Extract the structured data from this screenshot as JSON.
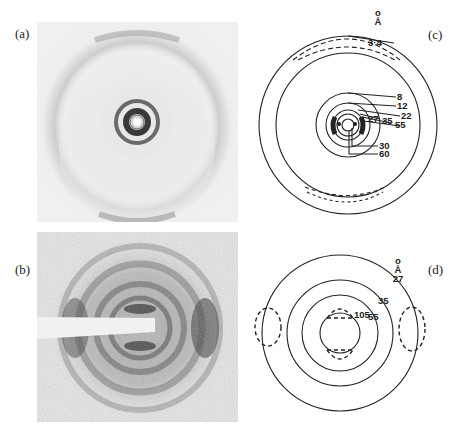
{
  "figure": {
    "panels": [
      {
        "id": "a",
        "label": "(a)",
        "type": "diffraction-photograph",
        "description": "X-ray diffraction pattern with strong central rings and faint outer arcs top and bottom"
      },
      {
        "id": "b",
        "label": "(b)",
        "type": "diffraction-photograph",
        "description": "Grainy diffraction pattern with beam stop bar from left; equatorial reflections"
      },
      {
        "id": "c",
        "label": "(c)",
        "type": "schematic",
        "unit_label": "Å",
        "spacings": [
          "3·4",
          "8",
          "12",
          "22",
          "27",
          "35",
          "55",
          "30",
          "60"
        ]
      },
      {
        "id": "d",
        "label": "(d)",
        "type": "schematic",
        "unit_label": "Å",
        "spacings": [
          "27",
          "35",
          "55",
          "105"
        ]
      }
    ]
  },
  "labels": {
    "a": "(a)",
    "b": "(b)",
    "c": "(c)",
    "d": "(d)"
  },
  "panel_c": {
    "unit": "Å",
    "unit_ring": "o",
    "r34": "3·4",
    "r8": "8",
    "r12": "12",
    "r22": "22",
    "r27": "27",
    "r35": "35",
    "r55": "55",
    "r30": "30",
    "r60": "60"
  },
  "panel_d": {
    "unit": "Å",
    "unit_ring": "o",
    "r27": "27",
    "r35": "35",
    "r55": "55",
    "r105": "105"
  }
}
